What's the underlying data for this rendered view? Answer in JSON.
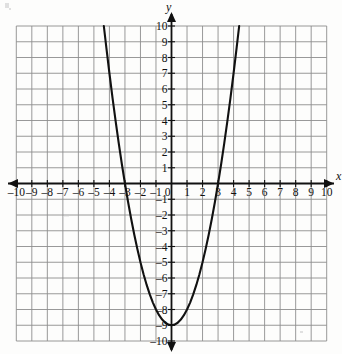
{
  "figure": {
    "background_color": "#fdfdfc",
    "grid_color": "#8d8d8d",
    "axis_color": "#111111",
    "curve_color": "#111111",
    "x_axis_name": "x",
    "y_axis_name": "y"
  },
  "chart_data": {
    "type": "line",
    "title": "",
    "xlabel": "x",
    "ylabel": "y",
    "xlim": [
      -10,
      10
    ],
    "ylim": [
      -10,
      10
    ],
    "grid": true,
    "legend": "none",
    "x_ticks": [
      -10,
      -9,
      -8,
      -7,
      -6,
      -5,
      -4,
      -3,
      -2,
      -1,
      0,
      1,
      2,
      3,
      4,
      5,
      6,
      7,
      8,
      9,
      10
    ],
    "y_ticks": [
      -10,
      -9,
      -8,
      -7,
      -6,
      -5,
      -4,
      -3,
      -2,
      -1,
      0,
      1,
      2,
      3,
      4,
      5,
      6,
      7,
      8,
      9,
      10
    ],
    "x_tick_labels": [
      "–10",
      "–9",
      "–8",
      "–7",
      "–6",
      "–5",
      "–4",
      "–3",
      "–2",
      "–1",
      "0",
      "1",
      "2",
      "3",
      "4",
      "5",
      "6",
      "7",
      "8",
      "9",
      "10"
    ],
    "y_tick_labels": [
      "–10",
      "–9",
      "–8",
      "–7",
      "–6",
      "–5",
      "–4",
      "–3",
      "–2",
      "–1",
      "0",
      "1",
      "2",
      "3",
      "4",
      "5",
      "6",
      "7",
      "8",
      "9",
      "10"
    ],
    "series": [
      {
        "name": "y = x² − 9",
        "equation": "y = x^2 - 9",
        "vertex": [
          0,
          -9
        ],
        "x_intercepts": [
          -3,
          3
        ],
        "y_intercept": -9,
        "x": [
          -4.36,
          -4.2,
          -4.0,
          -3.8,
          -3.6,
          -3.4,
          -3.2,
          -3.0,
          -2.8,
          -2.6,
          -2.4,
          -2.2,
          -2.0,
          -1.8,
          -1.6,
          -1.4,
          -1.2,
          -1.0,
          -0.8,
          -0.6,
          -0.4,
          -0.2,
          0.0,
          0.2,
          0.4,
          0.6,
          0.8,
          1.0,
          1.2,
          1.4,
          1.6,
          1.8,
          2.0,
          2.2,
          2.4,
          2.6,
          2.8,
          3.0,
          3.2,
          3.4,
          3.6,
          3.8,
          4.0,
          4.2,
          4.36
        ],
        "y": [
          10.0,
          8.64,
          7.0,
          5.44,
          3.96,
          2.56,
          1.24,
          0.0,
          -1.16,
          -2.24,
          -3.24,
          -4.16,
          -5.0,
          -5.76,
          -6.44,
          -7.04,
          -7.56,
          -8.0,
          -8.36,
          -8.64,
          -8.84,
          -8.96,
          -9.0,
          -8.96,
          -8.84,
          -8.64,
          -8.36,
          -8.0,
          -7.56,
          -7.04,
          -6.44,
          -5.76,
          -5.0,
          -4.16,
          -3.24,
          -2.24,
          -1.16,
          0.0,
          1.24,
          2.56,
          3.96,
          5.44,
          7.0,
          8.64,
          10.0
        ]
      }
    ]
  },
  "x_tick_positions": {
    "m10": 17,
    "m9": 32.5,
    "m8": 48,
    "m7": 63.5,
    "m6": 79,
    "m5": 94.5,
    "m4": 110,
    "m3": 125.5,
    "m2": 141,
    "m1": 156.5,
    "zero": 172,
    "p1": 187.5,
    "p2": 203,
    "p3": 218.5,
    "p4": 234,
    "p5": 249.5,
    "p6": 265,
    "p7": 280.5,
    "p8": 296,
    "p9": 311.5,
    "p10": 327
  }
}
